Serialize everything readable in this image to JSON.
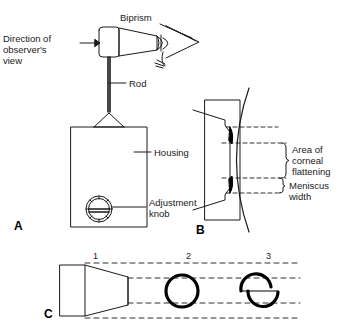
{
  "figure": {
    "stroke_color": "#1a1a1a",
    "fill_color": "#000000",
    "background": "#ffffff"
  },
  "panel_a": {
    "letter": "A",
    "labels": {
      "biprism": "Biprism",
      "direction": "Direction of\nobserver's\nview",
      "rod": "Rod",
      "housing": "Housing",
      "adjustment_knob": "Adjustment\nknob"
    }
  },
  "panel_b": {
    "letter": "B",
    "labels": {
      "corneal_flattening": "Area of\ncorneal\nflattening",
      "meniscus_width": "Meniscus\nwidth"
    }
  },
  "panel_c": {
    "letter": "C",
    "markers": [
      "1",
      "2",
      "3"
    ]
  }
}
